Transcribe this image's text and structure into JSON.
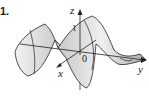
{
  "figure": {
    "number_label": "1.",
    "axes": {
      "x_label": "x",
      "y_label": "y",
      "z_label": "z",
      "origin_label": "0",
      "z_tick_label": "1"
    },
    "colors": {
      "surface_fill": "#d9d9d9",
      "surface_shade": "#b8b8b8",
      "lines": "#222222"
    }
  }
}
